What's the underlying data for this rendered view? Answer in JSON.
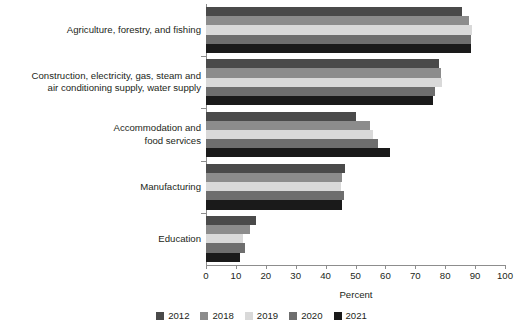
{
  "chart_data": {
    "type": "bar",
    "orientation": "horizontal",
    "title": "",
    "xlabel": "Percent",
    "ylabel": "",
    "xlim": [
      0,
      100
    ],
    "xticks": [
      0,
      10,
      20,
      30,
      40,
      50,
      60,
      70,
      80,
      90,
      100
    ],
    "grid": false,
    "legend_position": "bottom",
    "categories": [
      "Agriculture, forestry, and fishing",
      "Construction, electricity, gas, steam and air conditioning supply, water supply",
      "Accommodation and food services",
      "Manufacturing",
      "Education"
    ],
    "category_lines": [
      [
        "Agriculture, forestry, and fishing"
      ],
      [
        "Construction, electricity, gas, steam and",
        "air conditioning supply, water supply"
      ],
      [
        "Accommodation and",
        "food services"
      ],
      [
        "Manufacturing"
      ],
      [
        "Education"
      ]
    ],
    "series": [
      {
        "name": "2012",
        "color": "#4a4a4a",
        "values": [
          85.5,
          78.0,
          50.0,
          46.5,
          16.7
        ]
      },
      {
        "name": "2018",
        "color": "#8c8c8c",
        "values": [
          88.0,
          78.5,
          55.0,
          45.5,
          14.7
        ]
      },
      {
        "name": "2019",
        "color": "#d9d9d9",
        "values": [
          89.0,
          79.0,
          56.0,
          45.0,
          12.4
        ]
      },
      {
        "name": "2020",
        "color": "#6e6e6e",
        "values": [
          88.5,
          76.5,
          57.5,
          46.0,
          13.0
        ]
      },
      {
        "name": "2021",
        "color": "#1a1a1a",
        "values": [
          88.5,
          76.0,
          61.5,
          45.5,
          11.4
        ]
      }
    ]
  }
}
